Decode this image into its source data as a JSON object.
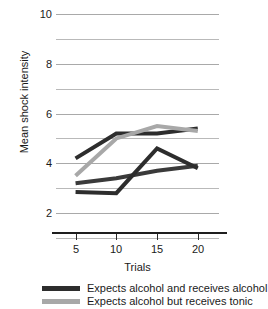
{
  "chart_data": {
    "type": "line",
    "title": "",
    "xlabel": "Trials",
    "ylabel": "Mean shock intensity",
    "x": [
      5,
      10,
      15,
      20
    ],
    "xtick_labels": [
      "5",
      "10",
      "15",
      "20"
    ],
    "ytick_labels": [
      "2",
      "4",
      "6",
      "8",
      "10"
    ],
    "ytick_values": [
      2,
      4,
      6,
      8,
      10
    ],
    "ylim": [
      1,
      10
    ],
    "xlim": [
      2.6,
      22.6
    ],
    "grid": "horizontal-major-and-minor",
    "legend_position": "below-axes-left",
    "series": [
      {
        "name": "Expects alcohol and receives alcohol",
        "color": "#2d2d2d",
        "values": [
          4.2,
          5.2,
          5.2,
          5.4
        ]
      },
      {
        "name": "Expects alcohol but receives tonic",
        "color": "#a8a8a8",
        "values": [
          3.5,
          5.0,
          5.5,
          5.3
        ]
      },
      {
        "name": "",
        "color": "#3a3a3a",
        "values": [
          3.2,
          3.4,
          3.7,
          3.9
        ]
      },
      {
        "name": "",
        "color": "#2d2d2d",
        "values": [
          2.85,
          2.8,
          4.6,
          3.8
        ]
      }
    ]
  },
  "legend": {
    "items": [
      {
        "label": "Expects alcohol and receives alcohol",
        "color": "#2d2d2d"
      },
      {
        "label": "Expects alcohol but receives tonic",
        "color": "#a8a8a8"
      }
    ]
  },
  "axes": {
    "x_title": "Trials",
    "y_title": "Mean shock intensity"
  }
}
